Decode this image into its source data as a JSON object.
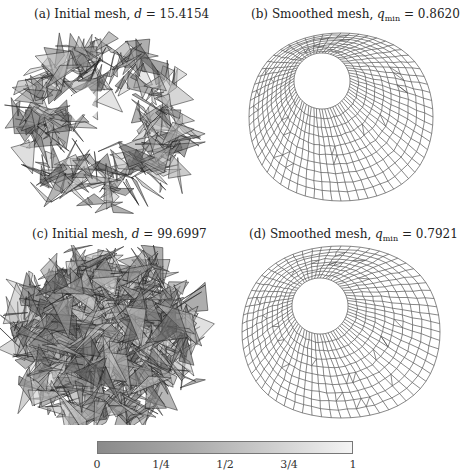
{
  "panels": [
    {
      "id": "a",
      "label": "(a)",
      "title": "Initial mesh,",
      "var": "d",
      "sub": "",
      "eq": "=",
      "value": "15.4154"
    },
    {
      "id": "b",
      "label": "(b)",
      "title": "Smoothed mesh,",
      "var": "q",
      "sub": "min",
      "eq": "=",
      "value": "0.8620"
    },
    {
      "id": "c",
      "label": "(c)",
      "title": "Initial mesh,",
      "var": "d",
      "sub": "",
      "eq": "=",
      "value": "99.6997"
    },
    {
      "id": "d",
      "label": "(d)",
      "title": "Smoothed mesh,",
      "var": "q",
      "sub": "min",
      "eq": "=",
      "value": "0.7921"
    }
  ],
  "colorbar": {
    "ticks": [
      "0",
      "1/4",
      "1/2",
      "3/4",
      "1"
    ],
    "color_low": "#8a8a8a",
    "color_high": "#f4f4f4"
  },
  "colors": {
    "mesh_line": "#555555",
    "tangle_fill": "#6e6e6e",
    "tangle_edge": "#1a1a1a"
  }
}
